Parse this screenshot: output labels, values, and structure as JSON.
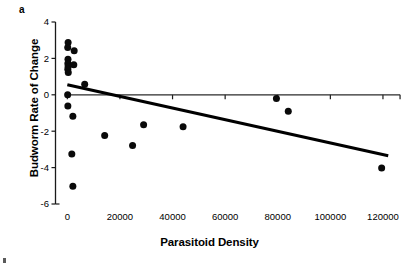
{
  "figure": {
    "panel_label": "a",
    "background_color": "#ffffff",
    "ink_color": "#000000"
  },
  "chart_data": {
    "type": "scatter",
    "title": "",
    "subtitle": "",
    "panel_label": "a",
    "xlabel": "Parasitoid Density",
    "ylabel": "Budworm Rate of Change",
    "xlim": [
      -4500,
      128000
    ],
    "ylim": [
      -6,
      4
    ],
    "xticks": [
      0,
      20000,
      40000,
      60000,
      80000,
      100000,
      120000
    ],
    "xticklabels": [
      "0",
      "20000",
      "40000",
      "60000",
      "80000",
      "100000",
      "120000"
    ],
    "yticks": [
      4,
      2,
      0,
      -2,
      -4,
      -6
    ],
    "yticklabels": [
      "4",
      "2",
      "0",
      "-2",
      "-4",
      "-6"
    ],
    "grid": false,
    "legend": null,
    "legend_position": "none",
    "marker": "filled-circle",
    "marker_color": "#0a0a0a",
    "marker_size": 7,
    "points": [
      {
        "x": 300,
        "y": 2.88
      },
      {
        "x": 150,
        "y": 2.6
      },
      {
        "x": 2600,
        "y": 2.42
      },
      {
        "x": 250,
        "y": 1.95
      },
      {
        "x": 200,
        "y": 1.72
      },
      {
        "x": 2450,
        "y": 1.65
      },
      {
        "x": 300,
        "y": 1.55
      },
      {
        "x": 180,
        "y": 1.4
      },
      {
        "x": 350,
        "y": 1.22
      },
      {
        "x": 6600,
        "y": 0.58
      },
      {
        "x": 120,
        "y": 0.0
      },
      {
        "x": 200,
        "y": -0.62
      },
      {
        "x": 2100,
        "y": -1.18
      },
      {
        "x": 29000,
        "y": -1.65
      },
      {
        "x": 44000,
        "y": -1.75
      },
      {
        "x": 79500,
        "y": -0.2
      },
      {
        "x": 84000,
        "y": -0.9
      },
      {
        "x": 14200,
        "y": -2.23
      },
      {
        "x": 24800,
        "y": -2.78
      },
      {
        "x": 1700,
        "y": -3.25
      },
      {
        "x": 2100,
        "y": -5.02
      },
      {
        "x": 119500,
        "y": -4.02
      }
    ],
    "trendline": {
      "type": "linear-regression",
      "color": "#000000",
      "width": 3,
      "x_start": 0,
      "y_start": 0.55,
      "x_end": 122000,
      "y_end": -3.35
    },
    "zero_reference_line": {
      "y": 0,
      "x_start": 0,
      "x_end": 126500,
      "color": "#2b2b2b"
    }
  }
}
